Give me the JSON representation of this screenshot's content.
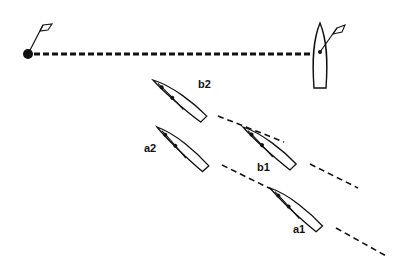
{
  "diagram": {
    "type": "sailing-start-line",
    "colors": {
      "ink": "#111111",
      "background": "#ffffff"
    },
    "start_line": {
      "style": "dashed",
      "from": [
        28,
        54
      ],
      "to": [
        318,
        54
      ]
    },
    "pin_mark": {
      "center": [
        28,
        54
      ],
      "flag": true
    },
    "committee_boat": {
      "bow": [
        320,
        24
      ],
      "stern": [
        320,
        88
      ],
      "flag": true
    },
    "boats": [
      {
        "id": "b2",
        "label": "b2",
        "bow": [
          153,
          80
        ],
        "stern": [
          210,
          112
        ],
        "label_pos": [
          198,
          86
        ]
      },
      {
        "id": "a2",
        "label": "a2",
        "bow": [
          157,
          127
        ],
        "stern": [
          211,
          162
        ],
        "label_pos": [
          144,
          151
        ]
      },
      {
        "id": "b1",
        "label": "b1",
        "bow": [
          243,
          127
        ],
        "stern": [
          299,
          160
        ],
        "label_pos": [
          257,
          170
        ]
      },
      {
        "id": "a1",
        "label": "a1",
        "bow": [
          270,
          188
        ],
        "stern": [
          326,
          222
        ],
        "label_pos": [
          293,
          232
        ]
      }
    ],
    "wakes": [
      {
        "boat": "b2",
        "from": [
          218,
          116
        ],
        "to": [
          284,
          142
        ]
      },
      {
        "boat": "a2",
        "from": [
          222,
          165
        ],
        "to": [
          273,
          190
        ]
      },
      {
        "boat": "b1",
        "from": [
          310,
          164
        ],
        "to": [
          358,
          188
        ]
      },
      {
        "boat": "a1",
        "from": [
          336,
          228
        ],
        "to": [
          388,
          257
        ]
      }
    ]
  }
}
